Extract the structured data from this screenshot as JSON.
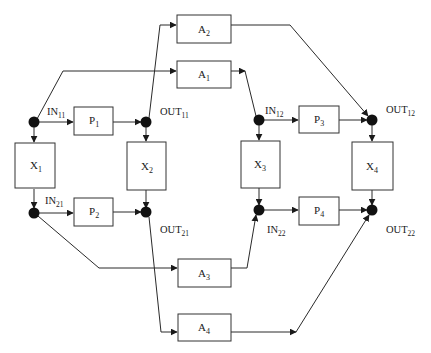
{
  "diagram": {
    "type": "flow-network",
    "boxes": {
      "A2": {
        "base": "A",
        "sub": "2"
      },
      "A1": {
        "base": "A",
        "sub": "1"
      },
      "A3": {
        "base": "A",
        "sub": "3"
      },
      "A4": {
        "base": "A",
        "sub": "4"
      },
      "P1": {
        "base": "P",
        "sub": "1"
      },
      "P2": {
        "base": "P",
        "sub": "2"
      },
      "P3": {
        "base": "P",
        "sub": "3"
      },
      "P4": {
        "base": "P",
        "sub": "4"
      },
      "X1": {
        "base": "X",
        "sub": "1"
      },
      "X2": {
        "base": "X",
        "sub": "2"
      },
      "X3": {
        "base": "X",
        "sub": "3"
      },
      "X4": {
        "base": "X",
        "sub": "4"
      }
    },
    "nodes": {
      "IN11": {
        "base": "IN",
        "sub": "11"
      },
      "OUT11": {
        "base": "OUT",
        "sub": "11"
      },
      "IN21": {
        "base": "IN",
        "sub": "21"
      },
      "OUT21": {
        "base": "OUT",
        "sub": "21"
      },
      "IN12": {
        "base": "IN",
        "sub": "12"
      },
      "OUT12": {
        "base": "OUT",
        "sub": "12"
      },
      "IN22": {
        "base": "IN",
        "sub": "22"
      },
      "OUT22": {
        "base": "OUT",
        "sub": "22"
      }
    },
    "edges": [
      {
        "from": "IN11",
        "to": "P1"
      },
      {
        "from": "P1",
        "to": "OUT11"
      },
      {
        "from": "IN11",
        "to": "X1"
      },
      {
        "from": "X1",
        "to": "IN21"
      },
      {
        "from": "OUT11",
        "to": "X2"
      },
      {
        "from": "X2",
        "to": "OUT21"
      },
      {
        "from": "IN21",
        "to": "P2"
      },
      {
        "from": "P2",
        "to": "OUT21"
      },
      {
        "from": "IN11",
        "to": "A1"
      },
      {
        "from": "OUT11",
        "to": "A2"
      },
      {
        "from": "IN21",
        "to": "A3"
      },
      {
        "from": "OUT21",
        "to": "A4"
      },
      {
        "from": "A1",
        "to": "IN12"
      },
      {
        "from": "A2",
        "to": "OUT12"
      },
      {
        "from": "A3",
        "to": "IN22"
      },
      {
        "from": "A4",
        "to": "OUT22"
      },
      {
        "from": "IN12",
        "to": "P3"
      },
      {
        "from": "P3",
        "to": "OUT12"
      },
      {
        "from": "IN12",
        "to": "X3"
      },
      {
        "from": "X3",
        "to": "IN22"
      },
      {
        "from": "OUT12",
        "to": "X4"
      },
      {
        "from": "X4",
        "to": "OUT22"
      },
      {
        "from": "IN22",
        "to": "P4"
      },
      {
        "from": "P4",
        "to": "OUT22"
      }
    ]
  }
}
